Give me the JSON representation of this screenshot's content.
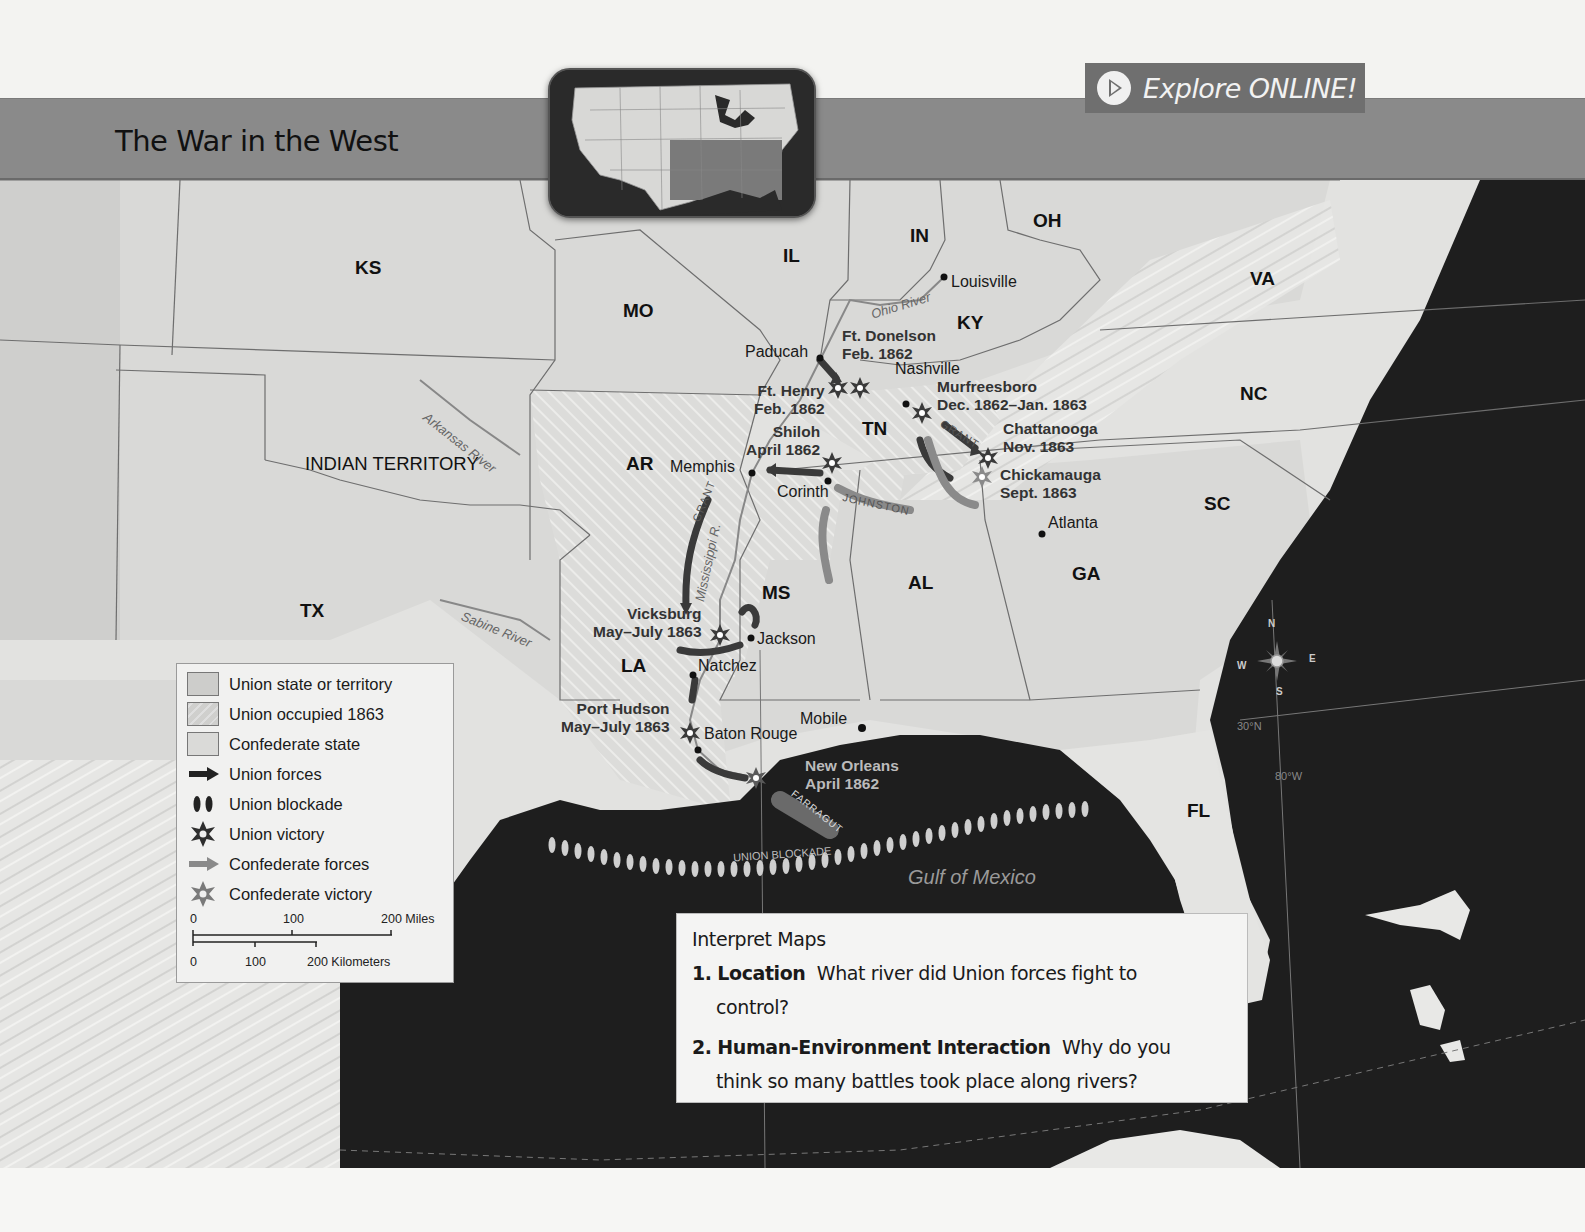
{
  "header": {
    "title": "The War in the West",
    "explore_button": "Explore ONLINE!",
    "explore_icon": "play-icon"
  },
  "colors": {
    "title_bar": "#8a8a8a",
    "explore_button_bg": "#6f6f6f",
    "land_union": "#d6d6d4",
    "land_confederate": "#e4e4e2",
    "water": "#1e1e1e",
    "legend_bg": "#f1f1f0"
  },
  "map": {
    "states": [
      {
        "code": "KS",
        "x": 355,
        "y": 257
      },
      {
        "code": "MO",
        "x": 623,
        "y": 300
      },
      {
        "code": "IL",
        "x": 783,
        "y": 245
      },
      {
        "code": "IN",
        "x": 910,
        "y": 225
      },
      {
        "code": "OH",
        "x": 1033,
        "y": 210
      },
      {
        "code": "KY",
        "x": 957,
        "y": 312
      },
      {
        "code": "VA",
        "x": 1250,
        "y": 268
      },
      {
        "code": "NC",
        "x": 1240,
        "y": 383
      },
      {
        "code": "TN",
        "x": 862,
        "y": 418
      },
      {
        "code": "AR",
        "x": 626,
        "y": 453
      },
      {
        "code": "SC",
        "x": 1204,
        "y": 493
      },
      {
        "code": "MS",
        "x": 762,
        "y": 582
      },
      {
        "code": "AL",
        "x": 908,
        "y": 572
      },
      {
        "code": "GA",
        "x": 1072,
        "y": 563
      },
      {
        "code": "TX",
        "x": 300,
        "y": 600
      },
      {
        "code": "LA",
        "x": 621,
        "y": 655
      },
      {
        "code": "FL",
        "x": 1187,
        "y": 800
      },
      {
        "code": "INDIAN TERRITORY",
        "x": 305,
        "y": 453
      }
    ],
    "cities": [
      {
        "name": "Louisville",
        "x": 946,
        "y": 273,
        "dot_x": 944,
        "dot_y": 277
      },
      {
        "name": "Paducah",
        "x": 745,
        "y": 343,
        "dot_x": 820,
        "dot_y": 358,
        "align": "left"
      },
      {
        "name": "Nashville",
        "x": 895,
        "y": 360,
        "dot_x": 906,
        "dot_y": 404
      },
      {
        "name": "Memphis",
        "x": 668,
        "y": 458,
        "dot_x": 752,
        "dot_y": 473,
        "align": "left"
      },
      {
        "name": "Corinth",
        "x": 777,
        "y": 483,
        "dot_x": 828,
        "dot_y": 481
      },
      {
        "name": "Atlanta",
        "x": 1046,
        "y": 514,
        "dot_x": 1042,
        "dot_y": 534
      },
      {
        "name": "Jackson",
        "x": 756,
        "y": 630,
        "dot_x": 751,
        "dot_y": 638
      },
      {
        "name": "Natchez",
        "x": 697,
        "y": 657,
        "dot_x": 693,
        "dot_y": 675
      },
      {
        "name": "Baton Rouge",
        "x": 704,
        "y": 725,
        "dot_x": 698,
        "dot_y": 750
      },
      {
        "name": "Mobile",
        "x": 800,
        "y": 710,
        "dot_x": 862,
        "dot_y": 728,
        "align": "left"
      }
    ],
    "battles": [
      {
        "name": "Ft. Donelson",
        "date": "Feb. 1862",
        "x": 842,
        "y": 327,
        "star_x": 860,
        "star_y": 388,
        "victory": "union"
      },
      {
        "name": "Ft. Henry",
        "date": "Feb. 1862",
        "x": 754,
        "y": 382,
        "star_x": 838,
        "star_y": 388,
        "victory": "union",
        "align": "right"
      },
      {
        "name": "Murfreesboro",
        "date": "Dec. 1862–Jan. 1863",
        "x": 937,
        "y": 378,
        "star_x": 922,
        "star_y": 413,
        "victory": "union"
      },
      {
        "name": "Shiloh",
        "date": "April 1862",
        "x": 746,
        "y": 423,
        "star_x": 832,
        "star_y": 463,
        "victory": "union",
        "align": "right"
      },
      {
        "name": "Chattanooga",
        "date": "Nov. 1863",
        "x": 1003,
        "y": 420,
        "star_x": 988,
        "star_y": 458,
        "victory": "union"
      },
      {
        "name": "Chickamauga",
        "date": "Sept. 1863",
        "x": 1000,
        "y": 466,
        "star_x": 982,
        "star_y": 477,
        "victory": "confederate"
      },
      {
        "name": "Vicksburg",
        "date": "May–July 1863",
        "x": 593,
        "y": 605,
        "star_x": 720,
        "star_y": 635,
        "victory": "union",
        "align": "right"
      },
      {
        "name": "Port Hudson",
        "date": "May–July 1863",
        "x": 561,
        "y": 700,
        "star_x": 690,
        "star_y": 733,
        "victory": "union",
        "align": "right"
      },
      {
        "name": "New Orleans",
        "date": "April 1862",
        "x": 805,
        "y": 757,
        "star_x": 756,
        "star_y": 778,
        "victory": "union",
        "light": true
      }
    ],
    "rivers": [
      {
        "name": "Ohio River",
        "x": 870,
        "y": 298,
        "rotate": -17
      },
      {
        "name": "Arkansas River",
        "x": 425,
        "y": 408,
        "rotate": 38
      },
      {
        "name": "Mississippi R.",
        "x": 693,
        "y": 555,
        "rotate": -78
      },
      {
        "name": "Sabine River",
        "x": 462,
        "y": 608,
        "rotate": 22
      }
    ],
    "force_labels": [
      {
        "name": "GRANT",
        "x": 686,
        "y": 495,
        "rotate": -68
      },
      {
        "name": "GRANT",
        "x": 938,
        "y": 428,
        "rotate": 32
      },
      {
        "name": "JOHNSTON",
        "x": 848,
        "y": 498,
        "rotate": 12
      },
      {
        "name": "FARRAGUT",
        "x": 790,
        "y": 800,
        "rotate": 38
      }
    ],
    "water_labels": [
      {
        "name": "Gulf of Mexico",
        "x": 908,
        "y": 867
      },
      {
        "name": "UNION BLOCKADE",
        "x": 730,
        "y": 848
      }
    ],
    "compass": {
      "n": "N",
      "s": "S",
      "e": "E",
      "w": "W",
      "x": 1272,
      "y": 660
    },
    "graticule": [
      {
        "label": "30°N",
        "x": 1237,
        "y": 720
      },
      {
        "label": "80°W",
        "x": 1275,
        "y": 770
      }
    ]
  },
  "legend": {
    "items": [
      {
        "label": "Union state or territory",
        "icon": "union-state-swatch"
      },
      {
        "label": "Union occupied 1863",
        "icon": "union-occupied-swatch"
      },
      {
        "label": "Confederate state",
        "icon": "confederate-state-swatch"
      },
      {
        "label": "Union forces",
        "icon": "union-forces-arrow-icon"
      },
      {
        "label": "Union blockade",
        "icon": "union-blockade-icon"
      },
      {
        "label": "Union victory",
        "icon": "union-victory-star-icon"
      },
      {
        "label": "Confederate forces",
        "icon": "confederate-forces-arrow-icon"
      },
      {
        "label": "Confederate victory",
        "icon": "confederate-victory-star-icon"
      }
    ],
    "scale": {
      "miles": [
        "0",
        "100",
        "200 Miles"
      ],
      "km": [
        "0",
        "100",
        "200 Kilometers"
      ]
    }
  },
  "interpret": {
    "title": "Interpret Maps",
    "questions": [
      {
        "num": "1.",
        "topic": "Location",
        "text": "What river did Union forces fight to",
        "cont": "control?"
      },
      {
        "num": "2.",
        "topic": "Human-Environment Interaction",
        "text": "Why do you",
        "cont": "think so many battles took place along rivers?"
      }
    ]
  }
}
